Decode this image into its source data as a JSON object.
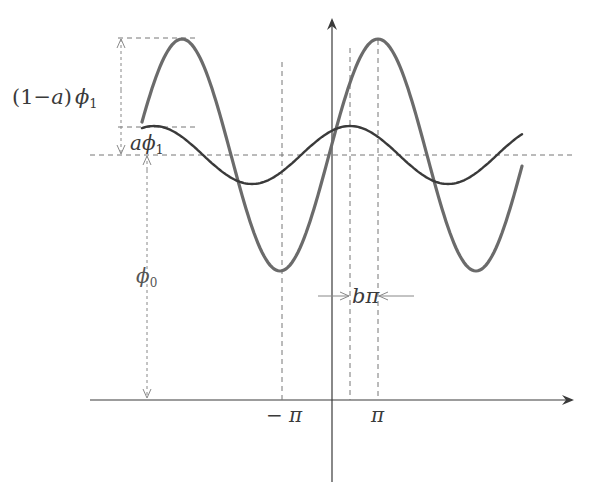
{
  "figure": {
    "type": "wave-diagram",
    "labels": {
      "amp_large_pre": "(1−",
      "amp_large_a": "a",
      "amp_large_post": ")",
      "amp_large_phi": "ϕ",
      "amp_large_sub": "1",
      "amp_small_a": "a",
      "amp_small_phi": "ϕ",
      "amp_small_sub": "1",
      "baseline_phi": "ϕ",
      "baseline_sub": "0",
      "shift_b": "b",
      "shift_pi": "π",
      "tick_neg_pi": "− π",
      "tick_pi": "π"
    },
    "colors": {
      "large_wave": "#6b6b6b",
      "small_wave": "#3a3a3a",
      "axis": "#3a3a3a",
      "dashed": "#777777"
    },
    "geometry": {
      "axis_x_y": 400,
      "axis_y_x": 332,
      "baseline_y": 155,
      "large_wave": {
        "amplitude": 116,
        "period": 196,
        "peak_x": 378,
        "x_start": 142,
        "x_end": 522
      },
      "small_wave": {
        "amplitude": 29,
        "period": 196,
        "peak_x": 350,
        "x_start": 142,
        "x_end": 522
      },
      "vlines_x": [
        282,
        350,
        378
      ]
    }
  }
}
